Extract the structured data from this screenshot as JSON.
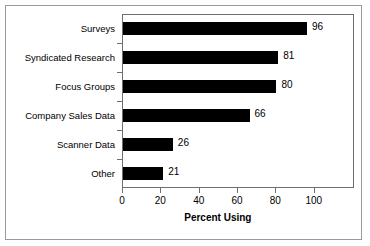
{
  "chart_data": {
    "type": "bar",
    "orientation": "horizontal",
    "title": "",
    "xlabel": "Percent Using",
    "ylabel": "",
    "xlim": [
      0,
      121
    ],
    "xticks": [
      0,
      20,
      40,
      60,
      80,
      100
    ],
    "xtick_labels": [
      "0",
      "20",
      "40",
      "60",
      "80",
      "100"
    ],
    "grid": false,
    "legend": null,
    "bar_color": "#000000",
    "categories": [
      "Surveys",
      "Syndicated Research",
      "Focus Groups",
      "Company Sales Data",
      "Scanner Data",
      "Other"
    ],
    "values": [
      96,
      81,
      80,
      66,
      26,
      21
    ],
    "value_labels": [
      "96",
      "81",
      "80",
      "66",
      "26",
      "21"
    ]
  },
  "figure": {
    "frame_color": "#9a9a9a",
    "plot_frame_color": "#6e6e6e",
    "background": "#ffffff"
  }
}
